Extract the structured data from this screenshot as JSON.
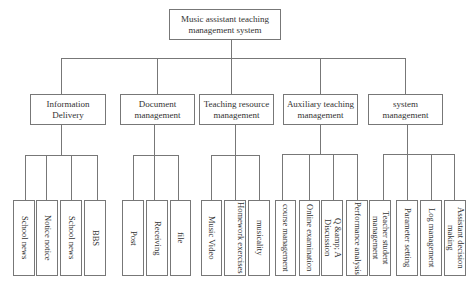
{
  "diagram": {
    "type": "hierarchy",
    "root": {
      "label": "Music assistant teaching management system"
    },
    "modules": [
      {
        "label": "Information Delivery",
        "children": [
          "School news",
          "Notice notice",
          "School news",
          "BBS"
        ]
      },
      {
        "label": "Document management",
        "children": [
          "Post",
          "Receiving",
          "file"
        ]
      },
      {
        "label": "Teaching resource management",
        "children": [
          "Music Video",
          "Homework exercises",
          "musicality"
        ]
      },
      {
        "label": "Auxiliary teaching management",
        "children": [
          "course management",
          "Online examination",
          "Q &amp; A Discussion",
          "Performance analysis"
        ]
      },
      {
        "label": "system management",
        "children": [
          "Teacher student management",
          "Parameter setting",
          "Log management",
          "Assistant decision making"
        ]
      }
    ]
  },
  "colors": {
    "line": "#777777",
    "text": "#333333",
    "background": "#ffffff"
  }
}
